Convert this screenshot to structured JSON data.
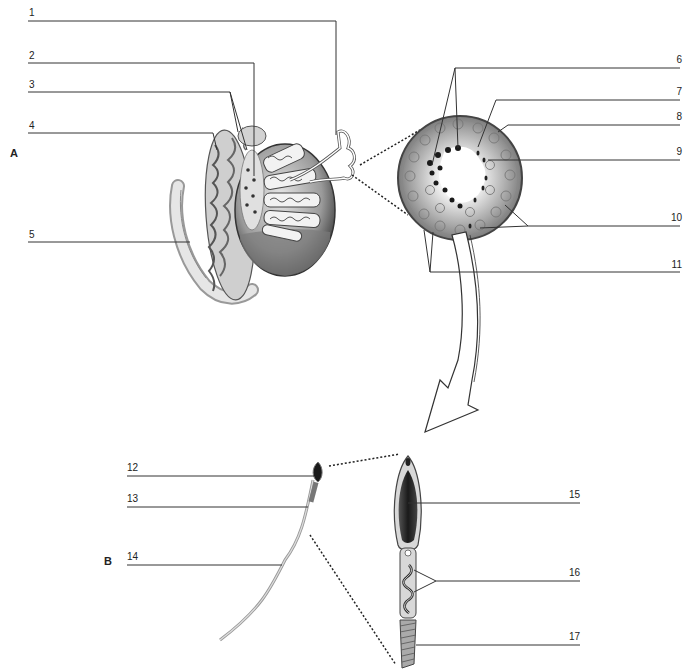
{
  "figure": {
    "panels": [
      {
        "id": "A",
        "label": "A"
      },
      {
        "id": "B",
        "label": "B"
      }
    ],
    "labels": [
      {
        "n": "1"
      },
      {
        "n": "2"
      },
      {
        "n": "3"
      },
      {
        "n": "4"
      },
      {
        "n": "5"
      },
      {
        "n": "6"
      },
      {
        "n": "7"
      },
      {
        "n": "8"
      },
      {
        "n": "9"
      },
      {
        "n": "10"
      },
      {
        "n": "11"
      },
      {
        "n": "12"
      },
      {
        "n": "13"
      },
      {
        "n": "14"
      },
      {
        "n": "15"
      },
      {
        "n": "16"
      },
      {
        "n": "17"
      }
    ],
    "colors": {
      "line": "#333333",
      "tissue_dark": "#2a2a2a",
      "tissue_mid": "#8a8a8a",
      "tissue_light": "#d6d6d6",
      "background": "#ffffff"
    }
  }
}
